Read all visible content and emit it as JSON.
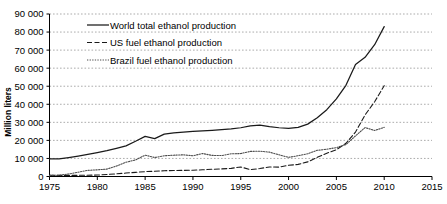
{
  "chart_data": {
    "type": "line",
    "title": "",
    "xlabel": "",
    "ylabel": "Million liters",
    "xlim": [
      1975,
      2015
    ],
    "ylim": [
      0,
      90000
    ],
    "grid": true,
    "legend_position": "top-left",
    "xticks": [
      "1975",
      "1980",
      "1985",
      "1990",
      "1995",
      "2000",
      "2005",
      "2010",
      "2015"
    ],
    "xtick_values": [
      1975,
      1980,
      1985,
      1990,
      1995,
      2000,
      2005,
      2010,
      2015
    ],
    "yticks": [
      "0",
      "10 000",
      "20 000",
      "30 000",
      "40 000",
      "50 000",
      "60 000",
      "70 000",
      "80 000",
      "90 000"
    ],
    "ytick_values": [
      0,
      10000,
      20000,
      30000,
      40000,
      50000,
      60000,
      70000,
      80000,
      90000
    ],
    "series": [
      {
        "name": "World total ethanol production",
        "style": "solid",
        "color": "#1a1a1a",
        "x": [
          1975,
          1976,
          1977,
          1978,
          1979,
          1980,
          1981,
          1982,
          1983,
          1984,
          1985,
          1986,
          1987,
          1988,
          1989,
          1990,
          1991,
          1992,
          1993,
          1994,
          1995,
          1996,
          1997,
          1998,
          1999,
          2000,
          2001,
          2002,
          2003,
          2004,
          2005,
          2006,
          2007,
          2008,
          2009,
          2010
        ],
        "values": [
          9800,
          9700,
          10500,
          11300,
          12200,
          13200,
          14300,
          15600,
          17000,
          19500,
          22200,
          21000,
          23500,
          24200,
          24600,
          25000,
          25300,
          25600,
          26000,
          26400,
          27000,
          28000,
          28500,
          27600,
          27000,
          26600,
          27200,
          29000,
          32500,
          37000,
          43000,
          50500,
          62000,
          66000,
          73000,
          83000
        ]
      },
      {
        "name": "US fuel ethanol production",
        "style": "dashed",
        "color": "#1a1a1a",
        "x": [
          1975,
          1976,
          1977,
          1978,
          1979,
          1980,
          1981,
          1982,
          1983,
          1984,
          1985,
          1986,
          1987,
          1988,
          1989,
          1990,
          1991,
          1992,
          1993,
          1994,
          1995,
          1996,
          1997,
          1998,
          1999,
          2000,
          2001,
          2002,
          2003,
          2004,
          2005,
          2006,
          2007,
          2008,
          2009,
          2010
        ],
        "values": [
          600,
          600,
          600,
          650,
          700,
          800,
          1100,
          1500,
          1900,
          2300,
          2700,
          2900,
          3200,
          3300,
          3400,
          3500,
          3700,
          4000,
          4200,
          4500,
          5300,
          3800,
          4400,
          5300,
          5200,
          6200,
          6700,
          8100,
          10600,
          12900,
          14800,
          18400,
          24600,
          34100,
          41400,
          50300
        ]
      },
      {
        "name": "Brazil fuel ethanol production",
        "style": "dotted",
        "color": "#4d4d4d",
        "x": [
          1975,
          1976,
          1977,
          1978,
          1979,
          1980,
          1981,
          1982,
          1983,
          1984,
          1985,
          1986,
          1987,
          1988,
          1989,
          1990,
          1991,
          1992,
          1993,
          1994,
          1995,
          1996,
          1997,
          1998,
          1999,
          2000,
          2001,
          2002,
          2003,
          2004,
          2005,
          2006,
          2007,
          2008,
          2009,
          2010
        ],
        "values": [
          600,
          700,
          1400,
          2400,
          3400,
          3700,
          4100,
          5800,
          7900,
          9200,
          11800,
          10500,
          11500,
          11800,
          12000,
          11500,
          12700,
          11700,
          11600,
          12600,
          12700,
          13900,
          14000,
          13500,
          12000,
          10600,
          11500,
          12600,
          14500,
          15100,
          16000,
          17700,
          22500,
          27100,
          25500,
          27200
        ]
      }
    ]
  },
  "legend": {
    "items": [
      {
        "label": "World total ethanol production",
        "style": "solid"
      },
      {
        "label": "US fuel ethanol production",
        "style": "dashed"
      },
      {
        "label": "Brazil fuel ethanol production",
        "style": "dotted"
      }
    ]
  },
  "axis": {
    "y_title": "Million liters"
  }
}
